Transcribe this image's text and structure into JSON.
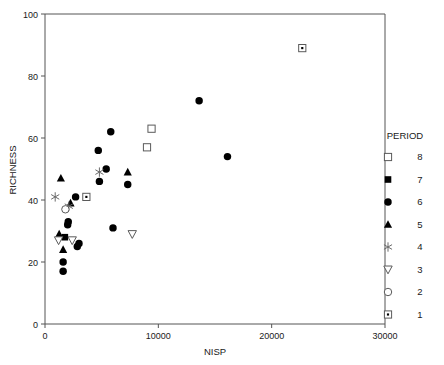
{
  "chart_data": {
    "type": "scatter",
    "title": "",
    "xlabel": "NISP",
    "ylabel": "RICHNESS",
    "xlim": [
      0,
      30000
    ],
    "ylim": [
      0,
      100
    ],
    "xticks": [
      0,
      10000,
      20000,
      30000
    ],
    "yticks": [
      0,
      20,
      40,
      60,
      80,
      100
    ],
    "xtick_labels": [
      "0",
      "10000",
      "20000",
      "30000"
    ],
    "ytick_labels": [
      "0",
      "20",
      "40",
      "60",
      "80",
      "100"
    ],
    "grid": false,
    "legend": {
      "title": "PERIOD",
      "position": "right",
      "entries": [
        {
          "label": "8",
          "marker": "open-square"
        },
        {
          "label": "7",
          "marker": "filled-square"
        },
        {
          "label": "6",
          "marker": "filled-circle"
        },
        {
          "label": "5",
          "marker": "filled-triangle-up"
        },
        {
          "label": "4",
          "marker": "star"
        },
        {
          "label": "3",
          "marker": "open-triangle-down"
        },
        {
          "label": "2",
          "marker": "open-circle"
        },
        {
          "label": "1",
          "marker": "dotted-square"
        }
      ]
    },
    "series": [
      {
        "name": "8",
        "marker": "open-square",
        "points": [
          {
            "x": 9400,
            "y": 63
          },
          {
            "x": 9000,
            "y": 57
          }
        ]
      },
      {
        "name": "7",
        "marker": "filled-square",
        "points": [
          {
            "x": 1750,
            "y": 28
          }
        ]
      },
      {
        "name": "6",
        "marker": "filled-circle",
        "points": [
          {
            "x": 13600,
            "y": 72
          },
          {
            "x": 16100,
            "y": 54
          },
          {
            "x": 5800,
            "y": 62
          },
          {
            "x": 4700,
            "y": 56
          },
          {
            "x": 5400,
            "y": 50
          },
          {
            "x": 4800,
            "y": 46
          },
          {
            "x": 7300,
            "y": 45
          },
          {
            "x": 2700,
            "y": 41
          },
          {
            "x": 2050,
            "y": 33
          },
          {
            "x": 2000,
            "y": 32
          },
          {
            "x": 6000,
            "y": 31
          },
          {
            "x": 3000,
            "y": 26
          },
          {
            "x": 2850,
            "y": 25
          },
          {
            "x": 1600,
            "y": 20
          },
          {
            "x": 1600,
            "y": 17
          }
        ]
      },
      {
        "name": "5",
        "marker": "filled-triangle-up",
        "points": [
          {
            "x": 7300,
            "y": 49
          },
          {
            "x": 1400,
            "y": 47
          },
          {
            "x": 2250,
            "y": 39
          },
          {
            "x": 1250,
            "y": 29
          },
          {
            "x": 1600,
            "y": 24
          }
        ]
      },
      {
        "name": "4",
        "marker": "star",
        "points": [
          {
            "x": 4800,
            "y": 49
          },
          {
            "x": 900,
            "y": 41
          },
          {
            "x": 2100,
            "y": 38
          }
        ]
      },
      {
        "name": "3",
        "marker": "open-triangle-down",
        "points": [
          {
            "x": 7700,
            "y": 29
          },
          {
            "x": 2400,
            "y": 27
          },
          {
            "x": 1200,
            "y": 27
          }
        ]
      },
      {
        "name": "2",
        "marker": "open-circle",
        "points": [
          {
            "x": 1800,
            "y": 37
          }
        ]
      },
      {
        "name": "1",
        "marker": "dotted-square",
        "points": [
          {
            "x": 22700,
            "y": 89
          },
          {
            "x": 3650,
            "y": 41
          }
        ]
      }
    ]
  }
}
